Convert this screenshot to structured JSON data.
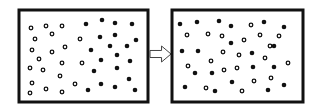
{
  "diagram": {
    "frame_color": "#111111",
    "particle_color": "#111111",
    "left_box": {
      "label": "before",
      "x": 19,
      "y": 10,
      "w": 129,
      "h": 92,
      "hollow": [
        [
          31,
          28
        ],
        [
          46,
          26
        ],
        [
          62,
          26
        ],
        [
          35,
          39
        ],
        [
          52,
          34
        ],
        [
          80,
          39
        ],
        [
          32,
          50
        ],
        [
          52,
          52
        ],
        [
          65,
          47
        ],
        [
          39,
          59
        ],
        [
          62,
          63
        ],
        [
          82,
          63
        ],
        [
          30,
          68
        ],
        [
          43,
          70
        ],
        [
          60,
          76
        ],
        [
          32,
          83
        ],
        [
          46,
          89
        ],
        [
          75,
          84
        ],
        [
          30,
          93
        ],
        [
          62,
          92
        ]
      ],
      "filled": [
        [
          86,
          24
        ],
        [
          102,
          20
        ],
        [
          115,
          23
        ],
        [
          132,
          24
        ],
        [
          100,
          37
        ],
        [
          115,
          35
        ],
        [
          136,
          40
        ],
        [
          91,
          50
        ],
        [
          110,
          46
        ],
        [
          127,
          46
        ],
        [
          117,
          55
        ],
        [
          101,
          60
        ],
        [
          130,
          61
        ],
        [
          94,
          71
        ],
        [
          117,
          68
        ],
        [
          129,
          79
        ],
        [
          101,
          84
        ],
        [
          115,
          87
        ],
        [
          88,
          90
        ],
        [
          135,
          90
        ]
      ]
    },
    "arrow": {
      "direction": "right",
      "x": 150,
      "y": 46,
      "w": 21,
      "h": 16
    },
    "right_box": {
      "label": "after",
      "x": 172,
      "y": 10,
      "w": 131,
      "h": 92,
      "filled": [
        [
          180,
          24
        ],
        [
          197,
          22
        ],
        [
          219,
          21
        ],
        [
          231,
          26
        ],
        [
          264,
          22
        ],
        [
          284,
          27
        ],
        [
          231,
          43
        ],
        [
          182,
          51
        ],
        [
          198,
          51
        ],
        [
          252,
          53
        ],
        [
          274,
          46
        ],
        [
          195,
          73
        ],
        [
          212,
          73
        ],
        [
          253,
          67
        ],
        [
          274,
          67
        ],
        [
          185,
          87
        ],
        [
          232,
          82
        ],
        [
          215,
          91
        ],
        [
          268,
          90
        ],
        [
          284,
          85
        ]
      ],
      "hollow": [
        [
          251,
          25
        ],
        [
          187,
          35
        ],
        [
          208,
          34
        ],
        [
          222,
          36
        ],
        [
          244,
          40
        ],
        [
          260,
          35
        ],
        [
          279,
          36
        ],
        [
          270,
          46
        ],
        [
          223,
          52
        ],
        [
          239,
          55
        ],
        [
          265,
          58
        ],
        [
          211,
          61
        ],
        [
          188,
          66
        ],
        [
          224,
          70
        ],
        [
          237,
          68
        ],
        [
          288,
          63
        ],
        [
          254,
          81
        ],
        [
          271,
          78
        ],
        [
          206,
          88
        ],
        [
          242,
          91
        ]
      ]
    }
  }
}
